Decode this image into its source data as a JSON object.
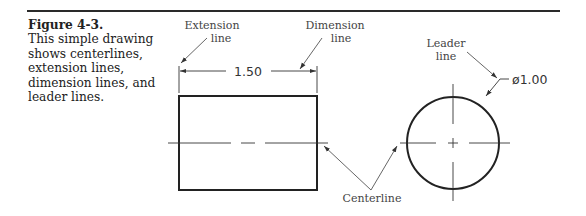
{
  "caption": {
    "figure_label": "Figure 4-3.",
    "text": "This simple drawing shows centerlines, extension lines, dimension lines, and leader lines."
  },
  "drawing": {
    "callouts": {
      "extension_line": [
        "Extension",
        "line"
      ],
      "dimension_line": [
        "Dimension",
        "line"
      ],
      "leader_line": [
        "Leader",
        "line"
      ],
      "centerline": "Centerline"
    },
    "dimensions": {
      "linear": "1.50",
      "diameter": "ø1.00"
    }
  }
}
